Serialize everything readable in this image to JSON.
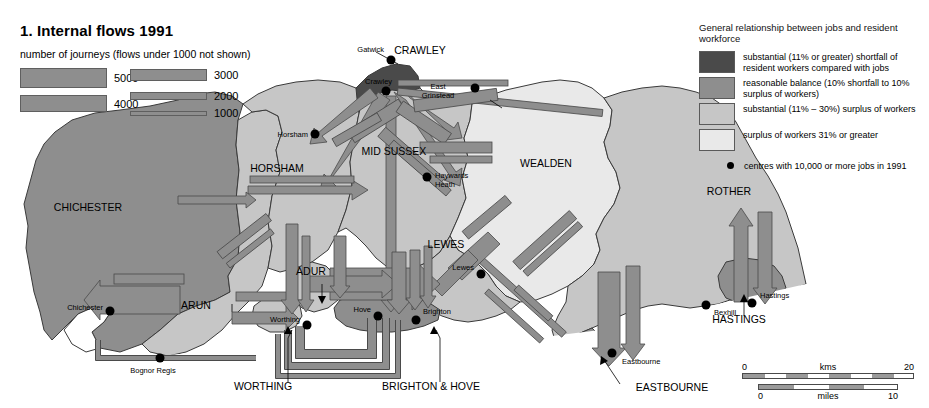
{
  "title": "1. Internal flows 1991",
  "journeys_key": {
    "heading": "number of journeys (flows under 1000 not shown)",
    "items": [
      {
        "label": "5000",
        "thickness": 20
      },
      {
        "label": "4000",
        "thickness": 16
      },
      {
        "label": "3000",
        "thickness": 11
      },
      {
        "label": "2000",
        "thickness": 7
      },
      {
        "label": "1000",
        "thickness": 4
      }
    ],
    "bar_color": "#8e8e8e"
  },
  "relationship_key": {
    "heading": "General relationship between jobs and resident workforce",
    "classes": [
      {
        "color": "#4a4a4a",
        "text": "substantial (11% or greater) shortfall of resident workers compared with jobs"
      },
      {
        "color": "#8e8e8e",
        "text": "reasonable balance (10% shortfall to 10% surplus of workers)"
      },
      {
        "color": "#c6c6c6",
        "text": "substantial (11% – 30%) surplus of workers"
      },
      {
        "color": "#e9e9e9",
        "text": "surplus of workers 31% or greater"
      }
    ],
    "point_note": "centres with 10,000 or more jobs in 1991"
  },
  "scale": {
    "km": {
      "unit": "kms",
      "min": "0",
      "max": "20"
    },
    "miles": {
      "unit": "miles",
      "min": "0",
      "max": "10"
    }
  },
  "districts": [
    {
      "name": "CRAWLEY",
      "x": 420,
      "y": 54,
      "class": 0
    },
    {
      "name": "HORSHAM",
      "x": 277,
      "y": 172,
      "class": 2
    },
    {
      "name": "MID SUSSEX",
      "x": 394,
      "y": 155,
      "class": 2
    },
    {
      "name": "WEALDEN",
      "x": 546,
      "y": 167,
      "class": 3
    },
    {
      "name": "ROTHER",
      "x": 729,
      "y": 195,
      "class": 2
    },
    {
      "name": "CHICHESTER",
      "x": 88,
      "y": 211,
      "class": 1
    },
    {
      "name": "LEWES",
      "x": 446,
      "y": 248,
      "class": 2
    },
    {
      "name": "ARUN",
      "x": 196,
      "y": 309,
      "class": 2
    },
    {
      "name": "ADUR",
      "x": 311,
      "y": 275,
      "class": 2
    },
    {
      "name": "HASTINGS",
      "x": 739,
      "y": 323,
      "class": 1
    },
    {
      "name": "WORTHING",
      "x": 263,
      "y": 390,
      "class": 2
    },
    {
      "name": "BRIGHTON & HOVE",
      "x": 370,
      "y": 390,
      "class": 1
    },
    {
      "name": "EASTBOURNE",
      "x": 622,
      "y": 391,
      "class": 1
    }
  ],
  "towns": [
    {
      "name": "Gatwick",
      "x": 386,
      "y": 49,
      "dot_x": 391,
      "dot_y": 60
    },
    {
      "name": "Crawley",
      "x": 377,
      "y": 81,
      "dot_x": 386,
      "dot_y": 91
    },
    {
      "name": "East Grinstead",
      "x": 442,
      "y": 90,
      "dot_x": 475,
      "dot_y": 88
    },
    {
      "name": "Horsham",
      "x": 284,
      "y": 136,
      "dot_x": 315,
      "dot_y": 134
    },
    {
      "name": "Haywards Heath",
      "x": 432,
      "y": 178,
      "dot_x": 427,
      "dot_y": 177
    },
    {
      "name": "Lewes",
      "x": 468,
      "y": 269,
      "dot_x": 481,
      "dot_y": 274
    },
    {
      "name": "Chichester",
      "x": 80,
      "y": 308,
      "dot_x": 110,
      "dot_y": 311
    },
    {
      "name": "Worthing",
      "x": 282,
      "y": 320,
      "dot_x": 307,
      "dot_y": 325
    },
    {
      "name": "Hove",
      "x": 365,
      "y": 310,
      "dot_x": 378,
      "dot_y": 316
    },
    {
      "name": "Brighton",
      "x": 412,
      "y": 310,
      "dot_x": 416,
      "dot_y": 320
    },
    {
      "name": "Bognor Regis",
      "x": 152,
      "y": 371,
      "dot_x": 160,
      "dot_y": 358
    },
    {
      "name": "Bexhill",
      "x": 703,
      "y": 313,
      "dot_x": 706,
      "dot_y": 305
    },
    {
      "name": "Hastings",
      "x": 757,
      "y": 296,
      "dot_x": 752,
      "dot_y": 303
    },
    {
      "name": "Eastbourne",
      "x": 624,
      "y": 362,
      "dot_x": 612,
      "dot_y": 353
    }
  ],
  "colors": {
    "class0": "#4a4a4a",
    "class1": "#8e8e8e",
    "class2": "#c6c6c6",
    "class3": "#e9e9e9",
    "flow": "#8e8e8e",
    "flow_dark": "#6e6e6e",
    "outline": "#3a3a3a",
    "sea": "#ffffff"
  }
}
